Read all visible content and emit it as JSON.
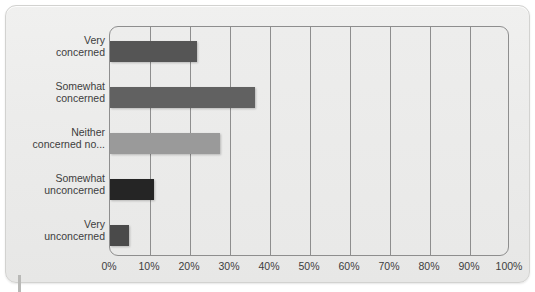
{
  "chart_data": {
    "type": "bar",
    "orientation": "horizontal",
    "title": "",
    "xlabel": "",
    "ylabel": "",
    "categories": [
      "Very\nconcerned",
      "Somewhat\nconcerned",
      "Neither\nconcerned no...",
      "Somewhat\nunconcerned",
      "Very\nunconcerned"
    ],
    "values": [
      21.8,
      36.2,
      27.5,
      11.0,
      4.8
    ],
    "value_suffix": "%",
    "xlim": [
      0,
      100
    ],
    "x_ticks": [
      0,
      10,
      20,
      30,
      40,
      50,
      60,
      70,
      80,
      90,
      100
    ],
    "x_tick_labels": [
      "0%",
      "10%",
      "20%",
      "30%",
      "40%",
      "50%",
      "60%",
      "70%",
      "80%",
      "90%",
      "100%"
    ],
    "grid": "vertical",
    "legend": "none",
    "bar_colors": [
      "#555555",
      "#616161",
      "#9a9a9a",
      "#252525",
      "#4a4a4a"
    ],
    "colors": {
      "card_background": "#ececeb",
      "plot_background": "#ebebea",
      "gridline": "#8e8e8e",
      "text": "#3d3d3d",
      "border": "#d2d2d0"
    }
  }
}
